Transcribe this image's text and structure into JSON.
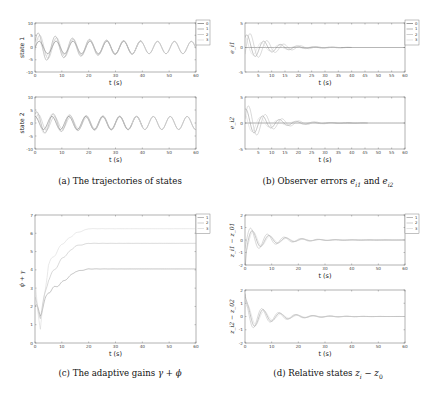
{
  "captions": {
    "a": "(a) The trajectories of states",
    "b_prefix": "(b) Observer errors ",
    "b_math1": "e",
    "b_sub1": "i1",
    "b_and": " and ",
    "b_math2": "e",
    "b_sub2": "i2",
    "c_prefix": "(c) The adaptive gains ",
    "c_math": "γ + ϕ",
    "d_prefix": "(d) Relative states ",
    "d_math": "z",
    "d_sub1": "i",
    "d_minus": " − ",
    "d_math2": "z",
    "d_sub2": "0"
  },
  "colors": {
    "series0": "#555555",
    "series1": "#888888",
    "series2": "#b0b0b0",
    "series3": "#d0d0d0",
    "axis": "#666666"
  },
  "chart_data": [
    {
      "id": "a1",
      "type": "line",
      "title": "",
      "xlabel": "t (s)",
      "ylabel": "state 1",
      "xlim": [
        0,
        60
      ],
      "ylim": [
        -10,
        10
      ],
      "xticks": [
        0,
        10,
        20,
        30,
        40,
        50,
        60
      ],
      "yticks": [
        -10,
        -5,
        0,
        5,
        10
      ],
      "legend": [
        "0",
        "1",
        "2",
        "3"
      ],
      "legend_position": "outside right top",
      "series": [
        {
          "name": "0",
          "description": "sinusoid amplitude ~2.5, period ~6.3 s over 0-60 s"
        },
        {
          "name": "1",
          "description": "oscillation amplitude up to ~6 early, converging to leader by ~30 s"
        },
        {
          "name": "2",
          "description": "oscillation amplitude up to ~5 early, converging to leader by ~30 s"
        },
        {
          "name": "3",
          "description": "oscillation amplitude ~4 early, converging to leader by ~30 s"
        }
      ]
    },
    {
      "id": "a2",
      "type": "line",
      "xlabel": "t (s)",
      "ylabel": "state 2",
      "xlim": [
        0,
        60
      ],
      "ylim": [
        -10,
        10
      ],
      "xticks": [
        0,
        10,
        20,
        30,
        40,
        50,
        60
      ],
      "yticks": [
        -10,
        -5,
        0,
        5,
        10
      ],
      "series": [
        {
          "name": "0",
          "description": "sinusoid amplitude ~2.5 (phase-shifted cosine)"
        },
        {
          "name": "1",
          "description": "peaks ~5, converges by ~30 s"
        },
        {
          "name": "2",
          "description": "peaks ~6, converges by ~30 s"
        },
        {
          "name": "3",
          "description": "peaks ~4, converges by ~30 s"
        }
      ]
    },
    {
      "id": "b1",
      "type": "line",
      "xlabel": "t (s)",
      "ylabel": "e_i1",
      "xlim": [
        0,
        60
      ],
      "ylim": [
        -5,
        5
      ],
      "xticks": [
        5,
        10,
        15,
        20,
        25,
        30,
        35,
        40,
        45,
        50,
        55,
        60
      ],
      "yticks": [
        -5,
        0,
        5
      ],
      "legend": [
        "0",
        "1",
        "2",
        "3"
      ],
      "series": [
        {
          "name": "0",
          "description": "zero line"
        },
        {
          "name": "1",
          "description": "decaying oscillation, initial amplitude ~2.5, near zero by ~30 s"
        },
        {
          "name": "2",
          "description": "decaying oscillation, initial amplitude ~3, near zero by ~30 s"
        },
        {
          "name": "3",
          "description": "decaying oscillation, initial amplitude ~2, near zero by ~30 s"
        }
      ]
    },
    {
      "id": "b2",
      "type": "line",
      "xlabel": "t (s)",
      "ylabel": "e_i2",
      "xlim": [
        0,
        60
      ],
      "ylim": [
        -5,
        5
      ],
      "xticks": [
        5,
        10,
        15,
        20,
        25,
        30,
        35,
        40,
        45,
        50,
        55,
        60
      ],
      "yticks": [
        -5,
        0,
        5
      ],
      "series": [
        {
          "name": "0",
          "description": "zero line"
        },
        {
          "name": "1",
          "description": "decaying oscillation, initial amplitude ~2.5"
        },
        {
          "name": "2",
          "description": "decaying oscillation, initial amplitude ~3.5"
        },
        {
          "name": "3",
          "description": "decaying oscillation, initial amplitude ~2"
        }
      ]
    },
    {
      "id": "c",
      "type": "line",
      "xlabel": "t (s)",
      "ylabel": "ϕ + γ",
      "xlim": [
        0,
        60
      ],
      "ylim": [
        0,
        7
      ],
      "xticks": [
        0,
        10,
        20,
        30,
        40,
        50,
        60
      ],
      "yticks": [
        0,
        1,
        2,
        3,
        4,
        5,
        6,
        7
      ],
      "legend": [
        "1",
        "2",
        "3"
      ],
      "legend_position": "outside right top",
      "series": [
        {
          "name": "1",
          "x": [
            0,
            2,
            5,
            10,
            15,
            20,
            60
          ],
          "values": [
            2.0,
            1.6,
            2.8,
            3.3,
            3.9,
            4.05,
            4.05
          ]
        },
        {
          "name": "2",
          "x": [
            0,
            2,
            5,
            10,
            15,
            20,
            60
          ],
          "values": [
            2.3,
            1.5,
            3.5,
            4.6,
            5.3,
            5.45,
            5.45
          ]
        },
        {
          "name": "3",
          "x": [
            0,
            2,
            5,
            10,
            15,
            20,
            60
          ],
          "values": [
            3.2,
            0.8,
            4.3,
            5.4,
            6.0,
            6.25,
            6.25
          ]
        }
      ]
    },
    {
      "id": "d1",
      "type": "line",
      "xlabel": "t (s)",
      "ylabel": "z_i1 − z_01",
      "xlim": [
        0,
        60
      ],
      "ylim": [
        -2,
        2
      ],
      "xticks": [
        0,
        10,
        20,
        30,
        40,
        50,
        60
      ],
      "yticks": [
        -2,
        -1,
        0,
        1,
        2
      ],
      "legend": [
        "1",
        "2",
        "3"
      ],
      "series": [
        {
          "name": "1",
          "description": "starts ~-1.8, decaying oscillation amplitude ~0.8, settles to 0 by ~30 s"
        },
        {
          "name": "2",
          "description": "decaying oscillation amplitude ~1, settles to 0 by ~30 s"
        },
        {
          "name": "3",
          "description": "decaying oscillation amplitude ~0.9, settles to 0 by ~30 s"
        }
      ]
    },
    {
      "id": "d2",
      "type": "line",
      "xlabel": "t (s)",
      "ylabel": "z_i2 − z_02",
      "xlim": [
        0,
        60
      ],
      "ylim": [
        -2,
        2
      ],
      "xticks": [
        0,
        10,
        20,
        30,
        40,
        50,
        60
      ],
      "yticks": [
        -2,
        -1,
        0,
        1,
        2
      ],
      "series": [
        {
          "name": "1",
          "description": "starts ~1.7, decaying oscillation, settles by ~30 s"
        },
        {
          "name": "2",
          "description": "decaying oscillation amplitude ~1"
        },
        {
          "name": "3",
          "description": "decaying oscillation amplitude ~0.9"
        }
      ]
    }
  ]
}
